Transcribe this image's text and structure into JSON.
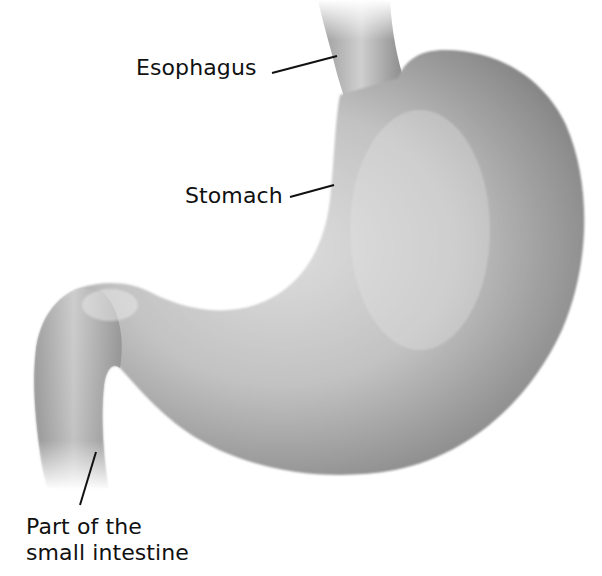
{
  "figure": {
    "colors": {
      "background": "#ffffff",
      "organ_light": "#d4d4d4",
      "organ_mid": "#a8a8a8",
      "organ_dark": "#6e6e6e",
      "leader_line": "#111111",
      "label_text": "#111111"
    }
  },
  "labels": {
    "esophagus": "Esophagus",
    "stomach": "Stomach",
    "intestine_line1": "Part of the",
    "intestine_line2": "small intestine"
  }
}
